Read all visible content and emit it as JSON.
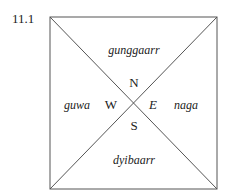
{
  "figure": {
    "number": "11.1"
  },
  "quadrants": {
    "north": "gunggaarr",
    "west": "guwa",
    "east": "naga",
    "south": "dyibaarr"
  },
  "compass": {
    "n": "N",
    "w": "W",
    "e": "E",
    "s": "S"
  },
  "colors": {
    "line": "#555555",
    "text": "#222222"
  }
}
